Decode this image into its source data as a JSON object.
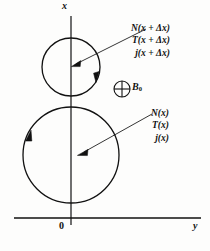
{
  "figure": {
    "type": "physics-diagram",
    "axes": {
      "vertical_label": "x",
      "horizontal_label": "y",
      "origin_label": "0"
    },
    "field": {
      "symbol_icon": "circled-plus-icon",
      "label": "B",
      "subscript": "0"
    },
    "callouts": [
      {
        "id": "upper",
        "target": "small-circle-center",
        "lines": [
          "N(x + Δx)",
          "T(x + Δx)",
          "j(x + Δx)"
        ]
      },
      {
        "id": "lower",
        "target": "large-circle-center",
        "lines": [
          "N(x)",
          "T(x)",
          "j(x)"
        ]
      }
    ],
    "shapes": {
      "small_circle": {
        "cx": 71,
        "cy": 67,
        "r": 29,
        "direction": "clockwise"
      },
      "large_circle": {
        "cx": 71,
        "cy": 155,
        "r": 48,
        "direction": "clockwise"
      }
    },
    "colors": {
      "ink": "#111111",
      "background": "#fdfdfc"
    }
  }
}
